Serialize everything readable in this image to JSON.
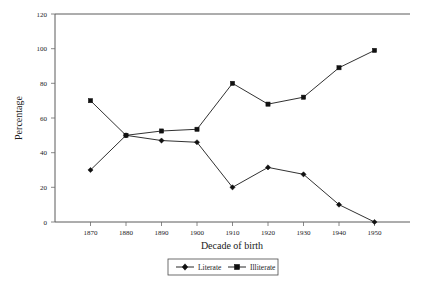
{
  "chart_data": {
    "type": "line",
    "title": "",
    "subtitle": "",
    "xlabel": "Decade of birth",
    "ylabel": "Percentage",
    "categories": [
      "1870",
      "1880",
      "1890",
      "1900",
      "1910",
      "1920",
      "1930",
      "1940",
      "1950"
    ],
    "x": [
      1870,
      1880,
      1890,
      1900,
      1910,
      1920,
      1930,
      1940,
      1950
    ],
    "series": [
      {
        "name": "Literate",
        "marker": "diamond",
        "color": "#111111",
        "values": [
          30,
          50,
          47,
          46,
          20,
          31.5,
          27.5,
          10,
          0
        ]
      },
      {
        "name": "Illiterate",
        "marker": "square",
        "color": "#111111",
        "values": [
          70,
          50,
          52.5,
          53.5,
          80,
          68,
          72,
          89,
          99
        ]
      }
    ],
    "ylim": [
      0,
      120
    ],
    "yticks": [
      0,
      20,
      40,
      60,
      80,
      100,
      120
    ],
    "ytick_labels": [
      "0",
      "20",
      "40",
      "60",
      "80",
      "100",
      "120"
    ],
    "xlim": [
      1865,
      1955
    ],
    "grid": false,
    "legend_position": "bottom",
    "legend_entries": [
      "Literate",
      "Illiterate"
    ]
  },
  "axes": {
    "y_title": "Percentage",
    "x_title": "Decade of birth"
  },
  "legend": {
    "items": [
      {
        "label": "Literate",
        "marker": "diamond-marker"
      },
      {
        "label": "Illiterate",
        "marker": "square-marker"
      }
    ]
  }
}
